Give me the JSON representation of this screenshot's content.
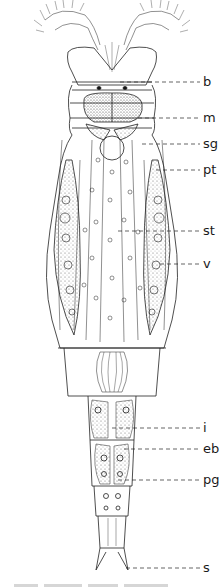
{
  "figure": {
    "type": "scientific-illustration",
    "labels": [
      {
        "key": "b",
        "text": "b",
        "y": 46
      },
      {
        "key": "m",
        "text": "m",
        "y": 72
      },
      {
        "key": "sg",
        "text": "sg",
        "y": 98
      },
      {
        "key": "pt",
        "text": "pt",
        "y": 114
      },
      {
        "key": "st",
        "text": "st",
        "y": 175
      },
      {
        "key": "v",
        "text": "v",
        "y": 206
      },
      {
        "key": "i",
        "text": "i",
        "y": 356
      },
      {
        "key": "eb",
        "text": "eb",
        "y": 420
      },
      {
        "key": "pg",
        "text": "pg",
        "y": 450
      },
      {
        "key": "s",
        "text": "s",
        "y": 565
      }
    ]
  }
}
